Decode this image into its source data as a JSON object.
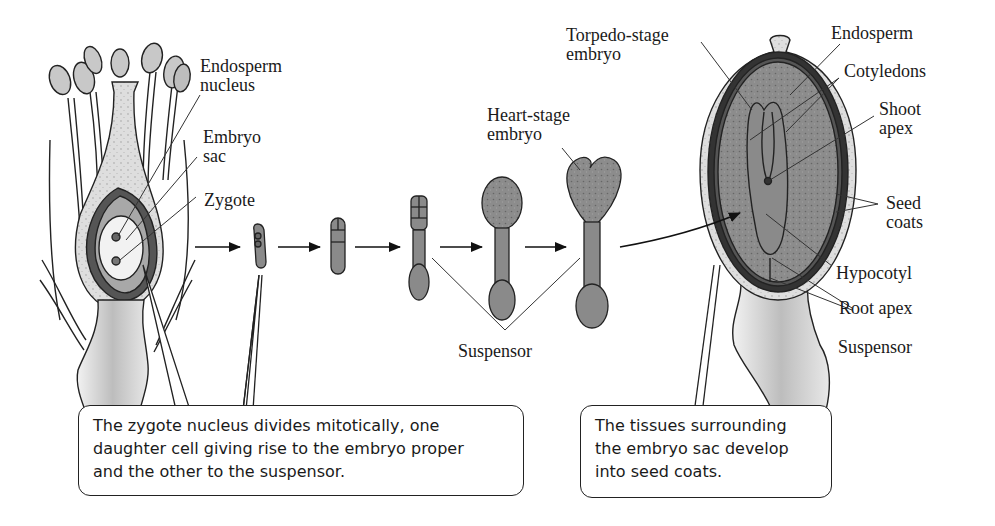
{
  "figure": {
    "stages": [
      "Zygote",
      "2-cell",
      "Octant",
      "Globular",
      "Heart-stage embryo",
      "Torpedo-stage embryo"
    ]
  },
  "flower_labels": {
    "endosperm_nucleus": "Endosperm\nnucleus",
    "embryo_sac": "Embryo\nsac",
    "zygote": "Zygote"
  },
  "stage_labels": {
    "heart_stage": "Heart-stage\nembryo",
    "suspensor": "Suspensor"
  },
  "seed_labels": {
    "torpedo_stage": "Torpedo-stage\nembryo",
    "endosperm": "Endosperm",
    "cotyledons": "Cotyledons",
    "shoot_apex": "Shoot\napex",
    "seed_coats": "Seed\ncoats",
    "hypocotyl": "Hypocotyl",
    "root_apex": "Root apex",
    "suspensor": "Suspensor"
  },
  "callouts": {
    "left": {
      "line1": "The zygote nucleus divides mitotically, one",
      "line2": "daughter cell giving rise to the embryo proper",
      "line3": "and the other to the suspensor."
    },
    "right": {
      "line1": "The tissues surrounding",
      "line2": "the embryo sac develop",
      "line3": "into seed coats."
    }
  },
  "colors": {
    "ink": "#1a1a1a",
    "tissue_dark": "#7a7a7a",
    "tissue_mid": "#a9a9a9",
    "tissue_light": "#d6d6d6",
    "seed_coat_band": "#3a3a3a"
  }
}
